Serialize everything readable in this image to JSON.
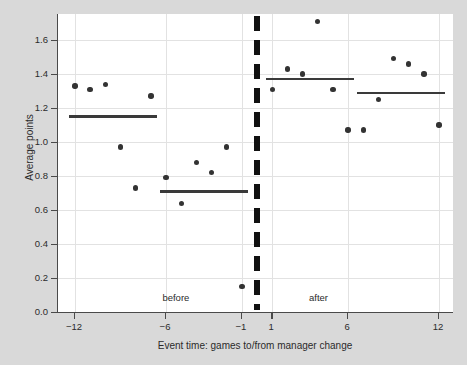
{
  "chart_data": {
    "type": "scatter",
    "title": "",
    "subtitle": "",
    "xlabel": "Event time: games to/from manager change",
    "ylabel": "Average points",
    "xlim": [
      -13.5,
      12.8
    ],
    "ylim": [
      0.0,
      1.75
    ],
    "grid": true,
    "legend_position": "none",
    "x_ticks": [
      {
        "value": -12,
        "label": "−12"
      },
      {
        "value": -6,
        "label": "−6"
      },
      {
        "value": -1,
        "label": "−1"
      },
      {
        "value": 1,
        "label": "1"
      },
      {
        "value": 6,
        "label": "6"
      },
      {
        "value": 12,
        "label": "12"
      }
    ],
    "y_ticks": [
      {
        "value": 0.0,
        "label": "0.0"
      },
      {
        "value": 0.2,
        "label": "0.2"
      },
      {
        "value": 0.4,
        "label": "0.4"
      },
      {
        "value": 0.6,
        "label": "0.6"
      },
      {
        "value": 0.8,
        "label": "0.8"
      },
      {
        "value": 1.0,
        "label": "1.0"
      },
      {
        "value": 1.2,
        "label": "1.2"
      },
      {
        "value": 1.4,
        "label": "1.4"
      },
      {
        "value": 1.6,
        "label": "1.6"
      }
    ],
    "x": [
      -12,
      -11,
      -10,
      -9,
      -8,
      -7,
      -6,
      -5,
      -4,
      -3,
      -2,
      -1,
      1,
      2,
      3,
      4,
      5,
      6,
      7,
      8,
      9,
      10,
      11,
      12
    ],
    "values": [
      1.33,
      1.31,
      1.34,
      0.97,
      0.73,
      1.27,
      0.79,
      0.64,
      0.88,
      0.82,
      0.97,
      0.15,
      1.31,
      1.43,
      1.4,
      1.71,
      1.31,
      1.07,
      1.07,
      1.25,
      1.49,
      1.46,
      1.4,
      1.1
    ],
    "series": [
      {
        "name": "Average points",
        "marker": "circle",
        "color": "#333333",
        "points": [
          {
            "x": -12,
            "y": 1.33
          },
          {
            "x": -11,
            "y": 1.31
          },
          {
            "x": -10,
            "y": 1.34
          },
          {
            "x": -9,
            "y": 0.97
          },
          {
            "x": -8,
            "y": 0.73
          },
          {
            "x": -7,
            "y": 1.27
          },
          {
            "x": -6,
            "y": 0.79
          },
          {
            "x": -5,
            "y": 0.64
          },
          {
            "x": -4,
            "y": 0.88
          },
          {
            "x": -3,
            "y": 0.82
          },
          {
            "x": -2,
            "y": 0.97
          },
          {
            "x": -1,
            "y": 0.15
          },
          {
            "x": 1,
            "y": 1.31
          },
          {
            "x": 2,
            "y": 1.43
          },
          {
            "x": 3,
            "y": 1.4
          },
          {
            "x": 4,
            "y": 1.71
          },
          {
            "x": 5,
            "y": 1.31
          },
          {
            "x": 6,
            "y": 1.07
          },
          {
            "x": 7,
            "y": 1.07
          },
          {
            "x": 8,
            "y": 1.25
          },
          {
            "x": 9,
            "y": 1.49
          },
          {
            "x": 10,
            "y": 1.46
          },
          {
            "x": 11,
            "y": 1.4
          },
          {
            "x": 12,
            "y": 1.1
          }
        ]
      }
    ],
    "mean_lines": [
      {
        "name": "before-early-mean",
        "x_start": -12.4,
        "x_end": -6.6,
        "y": 1.15,
        "color": "#3a3a3a"
      },
      {
        "name": "before-late-mean",
        "x_start": -6.4,
        "x_end": -0.6,
        "y": 0.71,
        "color": "#3a3a3a"
      },
      {
        "name": "after-early-mean",
        "x_start": 0.6,
        "x_end": 6.4,
        "y": 1.37,
        "color": "#3a3a3a"
      },
      {
        "name": "after-late-mean",
        "x_start": 6.6,
        "x_end": 12.4,
        "y": 1.29,
        "color": "#3a3a3a"
      }
    ],
    "event_line": {
      "x": 0,
      "style": "dashed",
      "color": "#111111",
      "width_px": 5.6
    },
    "annotations": [
      {
        "name": "before-label",
        "text": "before",
        "x": -5.35,
        "y": 0.115
      },
      {
        "name": "after-label",
        "text": "after",
        "x": 4.05,
        "y": 0.115
      }
    ]
  },
  "figure": {
    "background_color": "#d9d9d9",
    "panel_color": "#ffffff",
    "grid_color": "#e2e2e2",
    "axis_color": "#4a4a4a",
    "marker_color": "#333333"
  }
}
